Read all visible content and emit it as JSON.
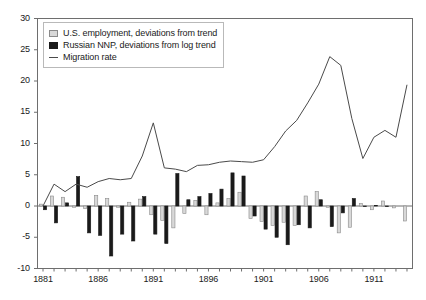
{
  "chart_data": {
    "type": "bar",
    "title": "",
    "subtitle": "",
    "xlabel": "",
    "ylabel": "",
    "xlim": [
      1880.5,
      1914.5
    ],
    "ylim": [
      -10,
      30
    ],
    "yticks": [
      -10,
      -5,
      0,
      5,
      10,
      15,
      20,
      25,
      30
    ],
    "ytick_labels": [
      "-10",
      "-5",
      "0",
      "5",
      "10",
      "15",
      "20",
      "25",
      "30"
    ],
    "xticks": [
      1881,
      1886,
      1891,
      1896,
      1901,
      1906,
      1911
    ],
    "xtick_labels": [
      "1881",
      "1886",
      "1891",
      "1896",
      "1901",
      "1906",
      "1911"
    ],
    "minor_xticks_every": 1,
    "grid": false,
    "zero_line": true,
    "legend_position": "top-left",
    "categories": [
      1881,
      1882,
      1883,
      1884,
      1885,
      1886,
      1887,
      1888,
      1889,
      1890,
      1891,
      1892,
      1893,
      1894,
      1895,
      1896,
      1897,
      1898,
      1899,
      1900,
      1901,
      1902,
      1903,
      1904,
      1905,
      1906,
      1907,
      1908,
      1909,
      1910,
      1911,
      1912,
      1913,
      1914
    ],
    "series": [
      {
        "name": "U.S. employment, deviations from trend",
        "type": "bar",
        "color": "#d8d8d8",
        "edge_color": "#8a8a8a",
        "values": [
          0.3,
          1.6,
          1.4,
          -0.2,
          -0.4,
          1.7,
          1.2,
          -0.2,
          0.6,
          1.1,
          -1.4,
          -2.3,
          -3.5,
          -1.2,
          0.9,
          -1.4,
          0.5,
          1.2,
          2.2,
          -2.0,
          -2.5,
          -3.1,
          -2.6,
          -3.1,
          1.6,
          2.3,
          -0.2,
          -4.3,
          -3.4,
          0.4,
          -0.6,
          0.8,
          -0.3,
          -2.4
        ]
      },
      {
        "name": "Russian NNP, deviations from log trend",
        "type": "bar",
        "color": "#1a1a1a",
        "edge_color": "#1a1a1a",
        "values": [
          -0.6,
          -2.7,
          0.5,
          4.7,
          -4.3,
          -4.7,
          -8.0,
          -4.5,
          -5.6,
          1.5,
          -4.5,
          -6.0,
          5.2,
          1.0,
          1.5,
          2.0,
          2.7,
          5.3,
          4.8,
          -1.6,
          -3.7,
          -5.0,
          -6.2,
          -3.0,
          -3.5,
          1.0,
          -3.3,
          -1.1,
          1.2,
          -0.1,
          0.1,
          -0.1,
          0.0,
          0.0
        ]
      },
      {
        "name": "Migration rate",
        "type": "line",
        "color": "#4a4a4a",
        "values": [
          0.0,
          3.5,
          2.3,
          3.5,
          3.0,
          3.9,
          4.4,
          4.2,
          4.4,
          8.0,
          13.3,
          6.1,
          5.9,
          5.5,
          6.5,
          6.6,
          7.0,
          7.2,
          7.1,
          7.0,
          7.4,
          9.5,
          12.0,
          13.7,
          16.5,
          19.5,
          23.9,
          22.5,
          14.0,
          7.6,
          11.0,
          12.1,
          11.0,
          19.4
        ]
      }
    ]
  },
  "legend": {
    "items": [
      {
        "label": "U.S. employment, deviations from trend",
        "swatch": "filled-square-light"
      },
      {
        "label": "Russian NNP, deviations from log trend",
        "swatch": "filled-square-dark"
      },
      {
        "label": "Migration rate",
        "swatch": "line-segment"
      }
    ]
  },
  "colors": {
    "us_bar": "#d8d8d8",
    "us_bar_edge": "#8a8a8a",
    "russia_bar": "#1a1a1a",
    "migration_line": "#4a4a4a",
    "axis": "#6e6e6e",
    "text": "#1a1a1a",
    "background": "#ffffff"
  }
}
